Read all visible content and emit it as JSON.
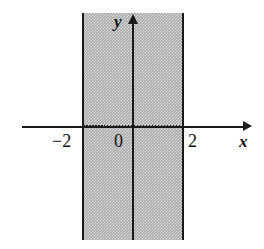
{
  "figure": {
    "background_color": "#ffffff",
    "shading_color": "#a9a9a9",
    "line_color": "#1a1a1a"
  },
  "axes": {
    "x_label": "x",
    "y_label": "y",
    "origin_label": "0",
    "x_tick_left": "−2",
    "x_tick_right": "2"
  },
  "chart_data": {
    "type": "area",
    "title": "",
    "xlabel": "x",
    "ylabel": "y",
    "xlim": [
      -4,
      4
    ],
    "ylim": [
      -4,
      4
    ],
    "grid": false,
    "legend": "none",
    "tick_labels": {
      "x": [
        "−2",
        "0",
        "2"
      ],
      "y": []
    },
    "shaded_region": {
      "description": "Vertical band of all points with -2 < x < 2, unbounded in y",
      "x_start": -2,
      "x_end": 2,
      "boundaries": "solid",
      "fill": "gray hatch"
    },
    "annotations": [
      {
        "text": "−2",
        "x": -2,
        "y": -0.45
      },
      {
        "text": "0",
        "x": -0.35,
        "y": -0.45
      },
      {
        "text": "2",
        "x": 2.25,
        "y": -0.45
      },
      {
        "text": "x",
        "x": 3.75,
        "y": -0.6
      },
      {
        "text": "y",
        "x": -0.45,
        "y": 3.8
      }
    ]
  }
}
